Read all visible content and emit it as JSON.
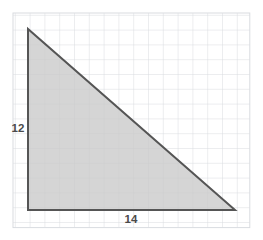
{
  "figure": {
    "type": "geometry-figure",
    "shape_name": "right-triangle",
    "canvas": {
      "width": 263,
      "height": 240,
      "background": "#ffffff"
    },
    "grid": {
      "visible": true,
      "line_color": "#d9dce0",
      "cell_size": 14.8,
      "x_start": 13,
      "y_start": 13,
      "columns": 16,
      "rows": 14.5,
      "border_color": "#d9dce0"
    },
    "triangle": {
      "fill_color": "#c9c9c9",
      "fill_opacity": 0.78,
      "stroke_color": "#555555",
      "stroke_width": 2,
      "vertices": [
        {
          "name": "apex",
          "x": 28,
          "y": 29
        },
        {
          "name": "bottom-left",
          "x": 28,
          "y": 210
        },
        {
          "name": "bottom-right",
          "x": 235,
          "y": 210
        }
      ],
      "points_attr": "28,29 28,210 235,210"
    },
    "labels": {
      "height": {
        "text": "12",
        "units_cells": 12,
        "side": "vertical-leg",
        "x": 18,
        "y": 132,
        "anchor": "middle"
      },
      "base": {
        "text": "14",
        "units_cells": 14,
        "side": "horizontal-leg",
        "x": 131,
        "y": 223,
        "anchor": "middle"
      }
    }
  }
}
